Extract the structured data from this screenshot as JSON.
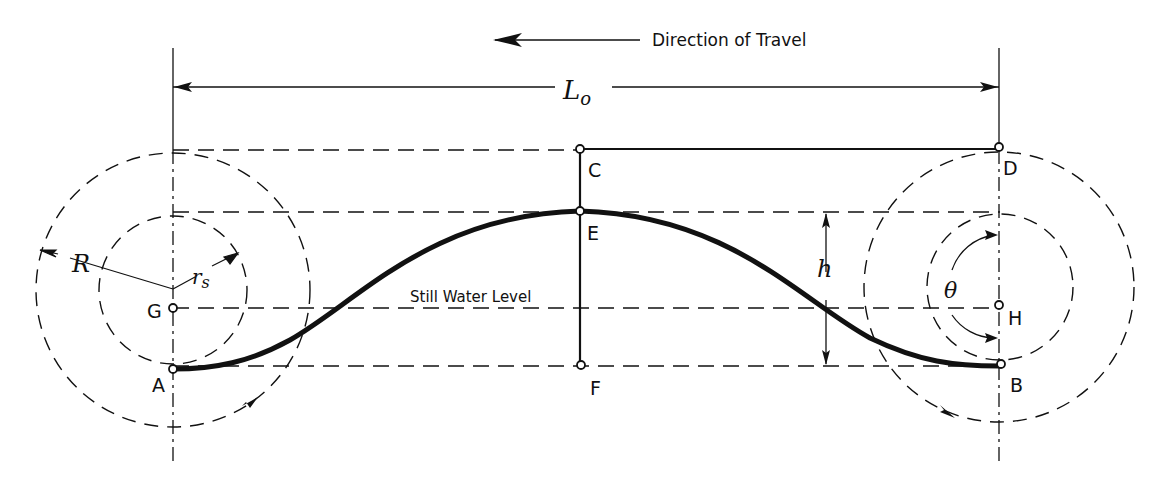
{
  "diagram": {
    "direction_label": "Direction of Travel",
    "length_label": "L",
    "length_subscript": "o",
    "still_water_label": "Still Water Level",
    "height_label": "h",
    "angle_label": "θ",
    "outer_radius_label": "R",
    "inner_radius_label": "r",
    "inner_radius_subscript": "s",
    "points": {
      "A": "A",
      "B": "B",
      "C": "C",
      "D": "D",
      "E": "E",
      "F": "F",
      "G": "G",
      "H": "H"
    },
    "colors": {
      "ink": "#111111",
      "background": "#ffffff"
    }
  }
}
